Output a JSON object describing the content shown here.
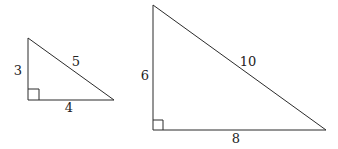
{
  "diagram": {
    "type": "similar-right-triangles",
    "triangles": [
      {
        "id": "small",
        "vertices": {
          "apex": [
            28,
            38
          ],
          "right_angle": [
            28,
            100
          ],
          "base_end": [
            114,
            100
          ]
        },
        "labels": {
          "vertical_leg": "3",
          "horizontal_leg": "4",
          "hypotenuse": "5"
        },
        "label_positions": {
          "vertical_leg": [
            18,
            75
          ],
          "horizontal_leg": [
            69,
            112
          ],
          "hypotenuse": [
            76,
            66
          ]
        }
      },
      {
        "id": "large",
        "vertices": {
          "apex": [
            153,
            5
          ],
          "right_angle": [
            153,
            130
          ],
          "base_end": [
            326,
            130
          ]
        },
        "labels": {
          "vertical_leg": "6",
          "horizontal_leg": "8",
          "hypotenuse": "10"
        },
        "label_positions": {
          "vertical_leg": [
            143,
            80
          ],
          "horizontal_leg": [
            236,
            143
          ],
          "hypotenuse": [
            248,
            66
          ]
        }
      }
    ],
    "stroke_color": "#2b2b2b",
    "label_color": "#222222"
  }
}
